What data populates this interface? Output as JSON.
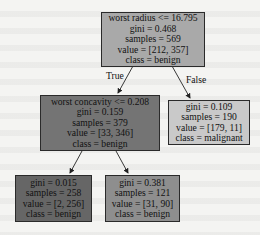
{
  "diagram": {
    "type": "decision-tree",
    "nodes": [
      {
        "id": "root",
        "lines": [
          "worst radius <= 16.795",
          "gini = 0.468",
          "samples = 569",
          "value = [212, 357]",
          "class = benign"
        ],
        "color": "#a9a9a9"
      },
      {
        "id": "left",
        "lines": [
          "worst concavity <= 0.208",
          "gini = 0.159",
          "samples = 379",
          "value = [33, 346]",
          "class = benign"
        ],
        "color": "#747474"
      },
      {
        "id": "right",
        "lines": [
          "gini = 0.109",
          "samples = 190",
          "value = [179, 11]",
          "class = malignant"
        ],
        "color": "#c9c9c9"
      },
      {
        "id": "left-left",
        "lines": [
          "gini = 0.015",
          "samples = 258",
          "value = [2, 256]",
          "class = benign"
        ],
        "color": "#666666"
      },
      {
        "id": "left-right",
        "lines": [
          "gini = 0.381",
          "samples = 121",
          "value = [31, 90]",
          "class = benign"
        ],
        "color": "#8e8e8e"
      }
    ],
    "edges": [
      {
        "from": "root",
        "to": "left",
        "label": "True"
      },
      {
        "from": "root",
        "to": "right",
        "label": "False"
      },
      {
        "from": "left",
        "to": "left-left",
        "label": ""
      },
      {
        "from": "left",
        "to": "left-right",
        "label": ""
      }
    ]
  }
}
